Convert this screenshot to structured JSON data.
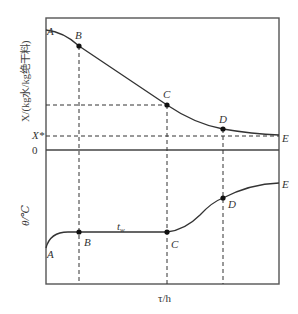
{
  "diagram": {
    "top_chart": {
      "ylabel": "X/(kg水/kg绝干料)",
      "tick_xstar": "X*",
      "tick_zero": "0",
      "points": [
        {
          "label": "A",
          "x": 46,
          "y": 30
        },
        {
          "label": "B",
          "x": 79,
          "y": 46
        },
        {
          "label": "C",
          "x": 167,
          "y": 105
        },
        {
          "label": "D",
          "x": 223,
          "y": 129
        },
        {
          "label": "E",
          "x": 279,
          "y": 135
        }
      ]
    },
    "bottom_chart": {
      "ylabel": "θ/℃",
      "tw_label": "t",
      "tw_sub": "w",
      "points": [
        {
          "label": "A",
          "x": 46,
          "y": 248
        },
        {
          "label": "B",
          "x": 79,
          "y": 232
        },
        {
          "label": "C",
          "x": 167,
          "y": 232
        },
        {
          "label": "D",
          "x": 223,
          "y": 198
        },
        {
          "label": "E",
          "x": 279,
          "y": 183
        }
      ]
    },
    "xlabel": "τ/h"
  }
}
